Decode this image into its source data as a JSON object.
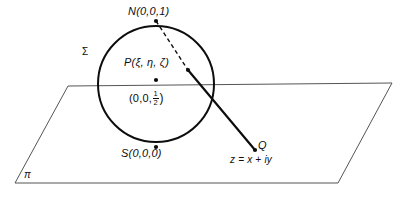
{
  "figure": {
    "background_color": "#ffffff",
    "ink_color": "#0d0d0d",
    "thin_line_color": "#555555",
    "labels": {
      "north_pole": "N(0,0,1)",
      "point_p": "P(ξ, η, ζ)",
      "south_pole": "S(0,0,0)",
      "sphere": "Σ",
      "plane": "π",
      "projection_point": "Q",
      "complex_number": "z = x + iy",
      "center_prefix": "(0,0,",
      "center_numerator": "1",
      "center_denominator": "2",
      "center_suffix": ")"
    },
    "geometry": {
      "sphere": {
        "center_x": 156,
        "center_y": 84,
        "radius": 58,
        "stroke_width": 2
      },
      "plane": {
        "top_left_x": 68,
        "top_left_y": 86,
        "top_right_x": 392,
        "top_right_y": 83,
        "bottom_right_x": 338,
        "bottom_right_y": 183,
        "bottom_left_x": 15,
        "bottom_left_y": 183,
        "stroke_width": 1
      },
      "dashed_segment": {
        "from_x": 156,
        "from_y": 21,
        "to_x": 188,
        "to_y": 70
      },
      "solid_ray": {
        "from_x": 188,
        "from_y": 70,
        "to_x": 255,
        "to_y": 150,
        "stroke_width": 2
      },
      "points": [
        {
          "name": "north-pole-dot",
          "x": 156,
          "y": 21
        },
        {
          "name": "point-p-dot",
          "x": 188,
          "y": 70
        },
        {
          "name": "sphere-center-dot",
          "x": 156,
          "y": 80
        },
        {
          "name": "south-pole-dot",
          "x": 156,
          "y": 147
        },
        {
          "name": "point-q-dot",
          "x": 255,
          "y": 150
        }
      ]
    },
    "caption": ""
  }
}
